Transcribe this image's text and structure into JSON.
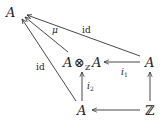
{
  "diagram": {
    "type": "commutative-diagram",
    "nodes": [
      {
        "id": "A_top",
        "label": "A",
        "x": 12,
        "y": 17
      },
      {
        "id": "AtensorA",
        "label_left": "A",
        "tensor": "⊗",
        "subscript": "ℤ",
        "label_right": "A",
        "x": 84,
        "y": 67
      },
      {
        "id": "A_right",
        "label": "A",
        "x": 146,
        "y": 67
      },
      {
        "id": "A_bottom",
        "label": "A",
        "x": 79,
        "y": 114
      },
      {
        "id": "Z",
        "label": "ℤ",
        "x": 146,
        "y": 114
      }
    ],
    "edges": [
      {
        "from": "Z",
        "to": "A_bottom",
        "label": ""
      },
      {
        "from": "Z",
        "to": "A_right",
        "label": ""
      },
      {
        "from": "A_right",
        "to": "AtensorA",
        "label": "i",
        "sub": "1"
      },
      {
        "from": "A_bottom",
        "to": "AtensorA",
        "label": "i",
        "sub": "2"
      },
      {
        "from": "AtensorA",
        "to": "A_top",
        "label": "μ"
      },
      {
        "from": "A_right",
        "to": "A_top",
        "label": "id"
      },
      {
        "from": "A_bottom",
        "to": "A_top",
        "label": "id"
      }
    ]
  }
}
